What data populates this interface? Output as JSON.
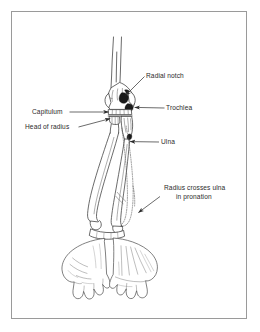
{
  "figure": {
    "view": "anterior",
    "border_color": "#9a9a9a",
    "line_color": "#3a3a3a",
    "shade_color": "#1a1a1a",
    "background_color": "#ffffff"
  },
  "labels": [
    {
      "id": "radial-notch",
      "text": "Radial notch",
      "lines": [
        "Radial notch"
      ],
      "text_x": 146,
      "text_y": 78,
      "anchor": "start",
      "leader": "M144.5,76.5 L124,96.5",
      "arrow_at": [
        124,
        96.5
      ],
      "arrow_angle": 136
    },
    {
      "id": "trochlea",
      "text": "Trochlea",
      "lines": [
        "Trochlea"
      ],
      "text_x": 166,
      "text_y": 110,
      "anchor": "start",
      "leader": "M164.5,108 L133,108",
      "arrow_at": [
        133,
        108
      ],
      "arrow_angle": 180
    },
    {
      "id": "capitulum",
      "text": "Capitulum",
      "lines": [
        "Capitulum"
      ],
      "text_x": 32,
      "text_y": 114,
      "anchor": "start",
      "leader": "M69,112 L110,112",
      "arrow_at": [
        110,
        112
      ],
      "arrow_angle": 0
    },
    {
      "id": "head-of-radius",
      "text": "Head of radius",
      "lines": [
        "Head of radius"
      ],
      "text_x": 25,
      "text_y": 129,
      "anchor": "start",
      "leader": "M78,127 L112,118",
      "arrow_at": [
        112,
        118
      ],
      "arrow_angle": -15
    },
    {
      "id": "ulna",
      "text": "Ulna",
      "lines": [
        "Ulna"
      ],
      "text_x": 161,
      "text_y": 144,
      "anchor": "start",
      "leader": "M159,142 L128,142",
      "arrow_at": [
        128,
        142
      ],
      "arrow_angle": 180
    },
    {
      "id": "radius-crosses-ulna",
      "text": "Radius crosses ulna in pronation",
      "lines": [
        "Radius crosses ulna",
        "in pronation"
      ],
      "text_x": 164,
      "text_y": 190,
      "anchor": "start",
      "leader": "M160,196 L137,214",
      "arrow_at": [
        137,
        214
      ],
      "arrow_angle": 142
    }
  ],
  "structures": [
    {
      "id": "humerus",
      "name": "Humerus shaft"
    },
    {
      "id": "lateral-epicondyle",
      "name": "Lateral epicondyle"
    },
    {
      "id": "medial-epicondyle",
      "name": "Medial epicondyle"
    },
    {
      "id": "radial-notch-shade",
      "name": "Radial notch (shaded)"
    },
    {
      "id": "trochlea-shade",
      "name": "Trochlea (shaded)"
    },
    {
      "id": "capitulum-surface",
      "name": "Capitulum articular surface"
    },
    {
      "id": "radius-head",
      "name": "Head of radius"
    },
    {
      "id": "radius-shaft",
      "name": "Radius shaft crossing ulna"
    },
    {
      "id": "ulna-shaft",
      "name": "Ulna shaft"
    },
    {
      "id": "ulna-ghost",
      "name": "Ulna supinated position (dotted)"
    },
    {
      "id": "left-hand",
      "name": "Left hand, palm toward viewer"
    },
    {
      "id": "right-hand",
      "name": "Right hand, dorsum toward viewer (pronated)"
    }
  ]
}
